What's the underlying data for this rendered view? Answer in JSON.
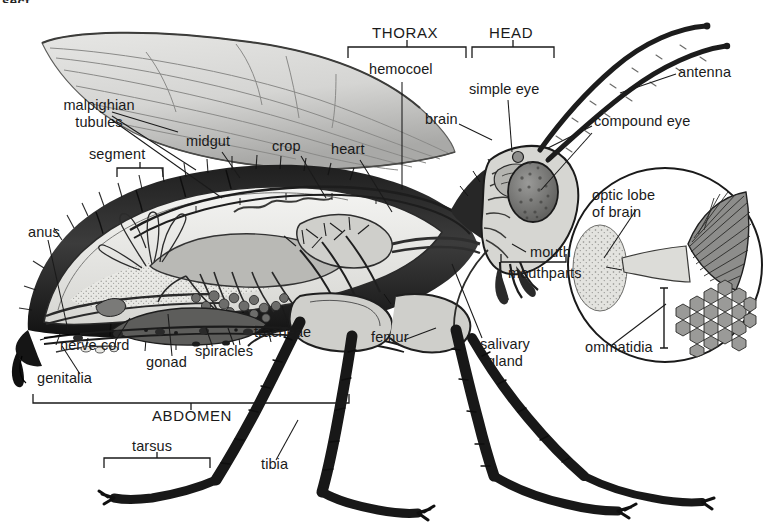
{
  "diagram": {
    "title_fragment": "sect",
    "background": "#ffffff",
    "ink": "#1a1a1a"
  },
  "region_labels": [
    {
      "id": "thorax",
      "text": "THORAX",
      "x": 372,
      "y": 33
    },
    {
      "id": "head",
      "text": "HEAD",
      "x": 489,
      "y": 33
    },
    {
      "id": "abdomen",
      "text": "ABDOMEN",
      "x": 152,
      "y": 416
    }
  ],
  "part_labels": [
    {
      "id": "malpighian-tubules",
      "text": "malpighian\ntubules",
      "x": 46,
      "y": 104
    },
    {
      "id": "segment",
      "text": "segment",
      "x": 89,
      "y": 154
    },
    {
      "id": "midgut",
      "text": "midgut",
      "x": 186,
      "y": 141
    },
    {
      "id": "crop",
      "text": "crop",
      "x": 272,
      "y": 146
    },
    {
      "id": "heart",
      "text": "heart",
      "x": 331,
      "y": 149
    },
    {
      "id": "hemocoel",
      "text": "hemocoel",
      "x": 369,
      "y": 69
    },
    {
      "id": "simple-eye",
      "text": "simple eye",
      "x": 469,
      "y": 89
    },
    {
      "id": "brain",
      "text": "brain",
      "x": 425,
      "y": 119
    },
    {
      "id": "antenna",
      "text": "antenna",
      "x": 678,
      "y": 72
    },
    {
      "id": "compound-eye",
      "text": "compound eye",
      "x": 594,
      "y": 121
    },
    {
      "id": "optic-lobe",
      "text": "optic lobe\nof brain",
      "x": 592,
      "y": 194
    },
    {
      "id": "mouth",
      "text": "mouth",
      "x": 530,
      "y": 252
    },
    {
      "id": "mouthparts",
      "text": "mouthparts",
      "x": 508,
      "y": 273
    },
    {
      "id": "ommatidia",
      "text": "ommatidia",
      "x": 585,
      "y": 347
    },
    {
      "id": "anus",
      "text": "anus",
      "x": 28,
      "y": 232
    },
    {
      "id": "nerve-cord",
      "text": "nerve cord",
      "x": 60,
      "y": 345
    },
    {
      "id": "genitalia",
      "text": "genitalia",
      "x": 37,
      "y": 378
    },
    {
      "id": "gonad",
      "text": "gonad",
      "x": 146,
      "y": 362
    },
    {
      "id": "spiracles",
      "text": "spiracles",
      "x": 195,
      "y": 351
    },
    {
      "id": "tracheae",
      "text": "tracheae",
      "x": 254,
      "y": 332
    },
    {
      "id": "femur",
      "text": "femur",
      "x": 371,
      "y": 337
    },
    {
      "id": "salivary-gland",
      "text": "salivary\ngland",
      "x": 469,
      "y": 343
    },
    {
      "id": "tarsus",
      "text": "tarsus",
      "x": 132,
      "y": 446
    },
    {
      "id": "tibia",
      "text": "tibia",
      "x": 261,
      "y": 464
    }
  ],
  "brackets": [
    {
      "id": "thorax-bracket",
      "x1": 348,
      "x2": 466,
      "y": 47,
      "orient": "down"
    },
    {
      "id": "head-bracket",
      "x1": 472,
      "x2": 554,
      "y": 47,
      "orient": "down"
    },
    {
      "id": "segment-bracket",
      "x1": 117,
      "x2": 163,
      "y": 168,
      "orient": "down"
    },
    {
      "id": "mouthparts-bracket",
      "x1": 501,
      "x2": 566,
      "y": 262,
      "orient": "down"
    },
    {
      "id": "abdomen-bracket",
      "x1": 33,
      "x2": 349,
      "y": 403,
      "orient": "down"
    },
    {
      "id": "tarsus-bracket",
      "x1": 104,
      "x2": 210,
      "y": 458,
      "orient": "down"
    }
  ],
  "palette": {
    "ink": "#1a1a1a",
    "wing_fill": "#d8d8d6",
    "wing_vein": "#8a8a88",
    "cuticle_dark": "#2b2b2b",
    "hemocoel_light": "#ececea",
    "gut_mid": "#9a9a98",
    "gonad_gray": "#6f6f6d",
    "eye_stipple": "#7b7b79",
    "inset_stroke": "#1a1a1a",
    "ommatidia_fill": "#8f8f8d"
  },
  "inset": {
    "id": "optic-lobe-inset",
    "shape": "circle",
    "cx": 665,
    "cy": 265,
    "r": 97
  }
}
